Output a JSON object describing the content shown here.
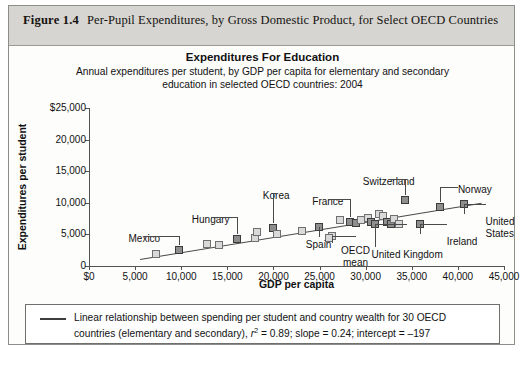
{
  "figure": {
    "label": "Figure 1.4",
    "caption": "Per-Pupil Expenditures, by Gross Domestic Product, for Select OECD Countries"
  },
  "chart_data": {
    "type": "scatter",
    "title": "Expenditures For Education",
    "subtitle": "Annual expenditures per student, by GDP per capita for elementary and secondary education in selected OECD countries: 2004",
    "xlabel": "GDP per capita",
    "ylabel": "Expenditures per student",
    "xlim": [
      0,
      45000
    ],
    "ylim": [
      0,
      25000
    ],
    "xticks": [
      "$0",
      "5,000",
      "10,000",
      "15,000",
      "20,000",
      "25,000",
      "30,000",
      "35,000",
      "40,000",
      "45,000"
    ],
    "yticks": [
      "$25,000",
      "20,000",
      "15,000",
      "10,000",
      "5,000",
      "0"
    ],
    "grid": false,
    "legend_position": "below-plot",
    "marker_color": "#8e8e8e",
    "marker_edge": "#3b3b3b",
    "line_color": "#4a4a4a",
    "fit": {
      "r_squared": 0.89,
      "slope": 0.24,
      "intercept": -197,
      "n_countries": 30
    },
    "points": [
      {
        "x": 7300,
        "y": 1900,
        "style": "light"
      },
      {
        "x": 9800,
        "y": 2600,
        "style": "dark"
      },
      {
        "x": 12800,
        "y": 3500,
        "style": "light"
      },
      {
        "x": 14100,
        "y": 3300,
        "style": "light"
      },
      {
        "x": 16100,
        "y": 4300,
        "style": "dark"
      },
      {
        "x": 18000,
        "y": 4400,
        "style": "light"
      },
      {
        "x": 18200,
        "y": 5400,
        "style": "light"
      },
      {
        "x": 19900,
        "y": 6000,
        "style": "dark"
      },
      {
        "x": 23100,
        "y": 5600,
        "style": "light"
      },
      {
        "x": 24900,
        "y": 6100,
        "style": "dark"
      },
      {
        "x": 26400,
        "y": 4700,
        "style": "light"
      },
      {
        "x": 27200,
        "y": 7300,
        "style": "light"
      },
      {
        "x": 28300,
        "y": 7000,
        "style": "dark"
      },
      {
        "x": 28900,
        "y": 6800,
        "style": "dark"
      },
      {
        "x": 29500,
        "y": 7200,
        "style": "light"
      },
      {
        "x": 30300,
        "y": 7600,
        "style": "light"
      },
      {
        "x": 30600,
        "y": 6900,
        "style": "dark"
      },
      {
        "x": 31000,
        "y": 6700,
        "style": "dark"
      },
      {
        "x": 31400,
        "y": 8200,
        "style": "light"
      },
      {
        "x": 31900,
        "y": 7900,
        "style": "light"
      },
      {
        "x": 32300,
        "y": 6900,
        "style": "dark"
      },
      {
        "x": 32700,
        "y": 6700,
        "style": "dark"
      },
      {
        "x": 33100,
        "y": 7500,
        "style": "light"
      },
      {
        "x": 33600,
        "y": 6600,
        "style": "light"
      },
      {
        "x": 34300,
        "y": 10400,
        "style": "dark"
      },
      {
        "x": 35900,
        "y": 6600,
        "style": "dark"
      },
      {
        "x": 38100,
        "y": 9300,
        "style": "dark"
      },
      {
        "x": 40700,
        "y": 9800,
        "style": "dark"
      },
      {
        "x": 26000,
        "y": 4500,
        "style": "light"
      },
      {
        "x": 20400,
        "y": 5100,
        "style": "light"
      }
    ],
    "annotations": [
      {
        "label": "Mexico",
        "text_x": 6000,
        "text_y": 5300
      },
      {
        "label": "Hungary",
        "text_x": 13200,
        "text_y": 8300
      },
      {
        "label": "Korea",
        "text_x": 20300,
        "text_y": 12100
      },
      {
        "label": "Spain",
        "text_x": 24900,
        "text_y": 4300
      },
      {
        "label": "France",
        "text_x": 25900,
        "text_y": 11100
      },
      {
        "label": "Switzerland",
        "text_x": 32500,
        "text_y": 14300
      },
      {
        "label": "Norway",
        "text_x": 40000,
        "text_y": 13000
      },
      {
        "label": "OECD mean",
        "text_x": 28900,
        "text_y": 3300
      },
      {
        "label": "United Kingdom",
        "text_x": 34500,
        "text_y": 2700
      },
      {
        "label": "Ireland",
        "text_x": 38800,
        "text_y": 4800
      },
      {
        "label": "United States",
        "text_x": 43000,
        "text_y": 7900
      }
    ]
  },
  "legend": {
    "note_part1": "Linear relationship between spending per student and country wealth for 30 OECD countries (elementary and secondary), ",
    "r_symbol": "r",
    "r_exponent": "2",
    "note_part2": " = 0.89; slope = 0.24; intercept = –197"
  }
}
